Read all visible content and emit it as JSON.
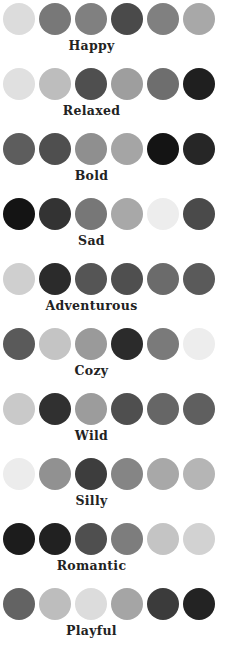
{
  "chart_data": {
    "type": "table",
    "title": "",
    "subtitle": "",
    "xlabel": "",
    "ylabel": "",
    "legend_position": "none",
    "grid": false,
    "swatch_shape": "circle",
    "swatches_visible_per_row": 5,
    "swatches_clipped_per_row": 1,
    "categories": [
      "Happy",
      "Relaxed",
      "Bold",
      "Sad",
      "Adventurous",
      "Cozy",
      "Wild",
      "Silly",
      "Romantic",
      "Playful"
    ],
    "palettes": [
      {
        "name": "Happy",
        "colors": [
          "#dcdcdc",
          "#787878",
          "#808080",
          "#4a4a4a",
          "#808080"
        ],
        "clipped_color": "#a8a8a8"
      },
      {
        "name": "Relaxed",
        "colors": [
          "#e0e0e0",
          "#bdbdbd",
          "#4f4f4f",
          "#9e9e9e",
          "#6e6e6e"
        ],
        "clipped_color": "#1f1f1f"
      },
      {
        "name": "Bold",
        "colors": [
          "#5d5d5d",
          "#4f4f4f",
          "#8f8f8f",
          "#a5a5a5",
          "#141414"
        ],
        "clipped_color": "#262626"
      },
      {
        "name": "Sad",
        "colors": [
          "#141414",
          "#333333",
          "#777777",
          "#a8a8a8",
          "#ededed"
        ],
        "clipped_color": "#4a4a4a"
      },
      {
        "name": "Adventurous",
        "colors": [
          "#cfcfcf",
          "#2b2b2b",
          "#555555",
          "#4f4f4f",
          "#6b6b6b"
        ],
        "clipped_color": "#5a5a5a"
      },
      {
        "name": "Cozy",
        "colors": [
          "#5a5a5a",
          "#c4c4c4",
          "#9a9a9a",
          "#2b2b2b",
          "#7a7a7a"
        ],
        "clipped_color": "#ededed"
      },
      {
        "name": "Wild",
        "colors": [
          "#c9c9c9",
          "#303030",
          "#9c9c9c",
          "#4f4f4f",
          "#666666"
        ],
        "clipped_color": "#5f5f5f"
      },
      {
        "name": "Silly",
        "colors": [
          "#ececec",
          "#919191",
          "#3d3d3d",
          "#858585",
          "#a8a8a8"
        ],
        "clipped_color": "#b5b5b5"
      },
      {
        "name": "Romantic",
        "colors": [
          "#1c1c1c",
          "#212121",
          "#4f4f4f",
          "#7d7d7d",
          "#c4c4c4"
        ],
        "clipped_color": "#d2d2d2"
      },
      {
        "name": "Playful",
        "colors": [
          "#636363",
          "#bdbdbd",
          "#dcdcdc",
          "#a5a5a5",
          "#3b3b3b"
        ],
        "clipped_color": "#232323"
      }
    ]
  }
}
